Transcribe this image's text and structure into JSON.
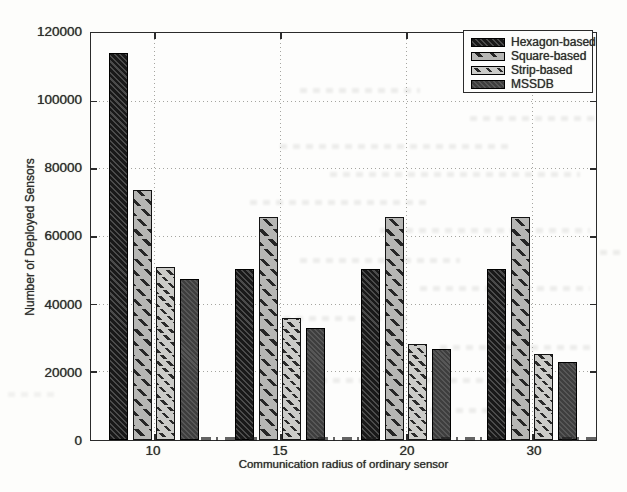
{
  "chart_data": {
    "type": "bar",
    "title": "",
    "xlabel": "Communication radius of ordinary sensor",
    "ylabel": "Number of Deployed Sensors",
    "categories": [
      "10",
      "15",
      "20",
      "30"
    ],
    "series": [
      {
        "name": "Hexagon-based",
        "style": "hexagon",
        "values": [
          114500,
          50500,
          50500,
          50500
        ]
      },
      {
        "name": "Square-based",
        "style": "square",
        "values": [
          74000,
          66000,
          66000,
          66000
        ]
      },
      {
        "name": "Strip-based",
        "style": "strip",
        "values": [
          51000,
          36000,
          28500,
          25500
        ]
      },
      {
        "name": "MSSDB",
        "style": "mssdb",
        "values": [
          47500,
          33000,
          27000,
          23000
        ]
      }
    ],
    "ylim": [
      0,
      120000
    ],
    "ytick_interval": 20000,
    "yticks": [
      "0",
      "20000",
      "40000",
      "60000",
      "80000",
      "100000",
      "120000"
    ],
    "grid": "dotted",
    "legend_position": "top-right",
    "colors": {
      "hexagon_fill": "#1c1c1c",
      "square_fill": "#b6b6b4",
      "strip_fill": "#cbcbc8",
      "mssdb_fill": "#454545",
      "axis": "#2b2b2b",
      "gridline": "#a5a5a0"
    }
  }
}
